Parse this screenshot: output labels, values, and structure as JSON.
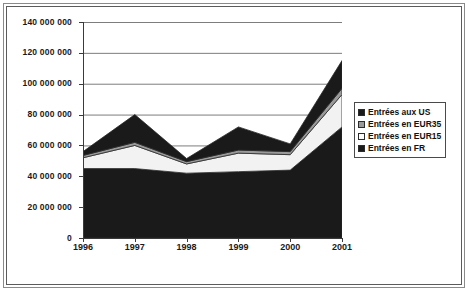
{
  "chart_data": {
    "type": "area",
    "stacked": true,
    "title": "",
    "xlabel": "",
    "ylabel": "",
    "categories": [
      "1996",
      "1997",
      "1998",
      "1999",
      "2000",
      "2001"
    ],
    "ylim": [
      0,
      140000000
    ],
    "yticks": [
      0,
      20000000,
      40000000,
      60000000,
      80000000,
      100000000,
      120000000,
      140000000
    ],
    "ytick_labels": [
      "0",
      "20 000 000",
      "40 000 000",
      "60 000 000",
      "80 000 000",
      "100 000 000",
      "120 000 000",
      "140 000 000"
    ],
    "grid": true,
    "grid_axis": "y",
    "legend_position": "right",
    "series": [
      {
        "name": "Entrées en FR",
        "color": "#1a1a1a",
        "values": [
          45000000,
          45000000,
          42000000,
          43000000,
          44000000,
          72000000
        ]
      },
      {
        "name": "Entrées en EUR15",
        "color": "#f2f2f2",
        "values": [
          7000000,
          15000000,
          6000000,
          12000000,
          10000000,
          21000000
        ]
      },
      {
        "name": "Entrées en EUR35",
        "color": "#9a9a9a",
        "values": [
          1500000,
          2000000,
          1500000,
          2000000,
          2000000,
          4000000
        ]
      },
      {
        "name": "Entrées aux US",
        "color": "#1a1a1a",
        "values": [
          2500000,
          18000000,
          2000000,
          15000000,
          5000000,
          18000000
        ]
      }
    ],
    "totals": [
      56000000,
      80000000,
      51500000,
      72000000,
      61000000,
      115000000
    ]
  },
  "legend": {
    "items": [
      {
        "label": "Entrées aux US",
        "swatch": "#1a1a1a"
      },
      {
        "label": "Entrées en EUR35",
        "swatch": "#9a9a9a"
      },
      {
        "label": "Entrées en EUR15",
        "swatch": "#fdfdfd"
      },
      {
        "label": "Entrées en FR",
        "swatch": "#1a1a1a"
      }
    ]
  },
  "colors": {
    "grid": "#7d7d7d",
    "axis": "#3a3a3a",
    "frame_outer": "#8a8a8a",
    "frame_inner": "#5b5b5b",
    "background": "#ffffff"
  }
}
